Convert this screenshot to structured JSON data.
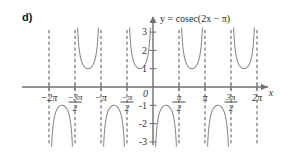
{
  "figure": {
    "part_label": "d)",
    "title": "y = cosec(2x − π)",
    "axis_label_x": "x",
    "origin_label": "0"
  },
  "chart_data": {
    "type": "line",
    "title": "y = cosec(2x − π)",
    "xlabel": "x",
    "ylabel": "y",
    "function": "y = cosec(2x - π)",
    "xlim": [
      -6.2832,
      6.2832
    ],
    "ylim": [
      -3,
      3
    ],
    "grid": false,
    "legend": null,
    "x_ticks": [
      {
        "value": -6.2832,
        "label": "−2π"
      },
      {
        "value": -4.7124,
        "label": "−3π/2"
      },
      {
        "value": -3.1416,
        "label": "−π"
      },
      {
        "value": -1.5708,
        "label": "−π/2"
      },
      {
        "value": 0,
        "label": "0"
      },
      {
        "value": 1.5708,
        "label": "π/2"
      },
      {
        "value": 3.1416,
        "label": "π"
      },
      {
        "value": 4.7124,
        "label": "3π/2"
      },
      {
        "value": 6.2832,
        "label": "2π"
      }
    ],
    "y_ticks": [
      {
        "value": 3,
        "label": "3"
      },
      {
        "value": 2,
        "label": "2"
      },
      {
        "value": 1,
        "label": "1"
      },
      {
        "value": 0,
        "label": "0"
      },
      {
        "value": -1,
        "label": "-1"
      },
      {
        "value": -2,
        "label": "-2"
      },
      {
        "value": -3,
        "label": "-3"
      }
    ],
    "asymptotes": [
      {
        "x": -6.2832,
        "label": "−2π"
      },
      {
        "x": -4.7124,
        "label": "−3π/2"
      },
      {
        "x": -3.1416,
        "label": "−π"
      },
      {
        "x": -1.5708,
        "label": "−π/2"
      },
      {
        "x": 0,
        "label": "0"
      },
      {
        "x": 1.5708,
        "label": "π/2"
      },
      {
        "x": 3.1416,
        "label": "π"
      },
      {
        "x": 4.7124,
        "label": "3π/2"
      },
      {
        "x": 6.2832,
        "label": "2π"
      }
    ],
    "branches": [
      {
        "interval": [
          -6.2832,
          -4.7124
        ],
        "orientation": "down",
        "extremum": -1
      },
      {
        "interval": [
          -4.7124,
          -3.1416
        ],
        "orientation": "up",
        "extremum": 1
      },
      {
        "interval": [
          -3.1416,
          -1.5708
        ],
        "orientation": "down",
        "extremum": -1
      },
      {
        "interval": [
          -1.5708,
          0
        ],
        "orientation": "up",
        "extremum": 1
      },
      {
        "interval": [
          0,
          1.5708
        ],
        "orientation": "down",
        "extremum": -1
      },
      {
        "interval": [
          1.5708,
          3.1416
        ],
        "orientation": "up",
        "extremum": 1
      },
      {
        "interval": [
          3.1416,
          4.7124
        ],
        "orientation": "down",
        "extremum": -1
      },
      {
        "interval": [
          4.7124,
          6.2832
        ],
        "orientation": "up",
        "extremum": 1
      }
    ],
    "colors": {
      "curve": "#8a8a8a",
      "axis": "#6e6e6e",
      "asymptote": "#555555",
      "text": "#333333"
    }
  }
}
